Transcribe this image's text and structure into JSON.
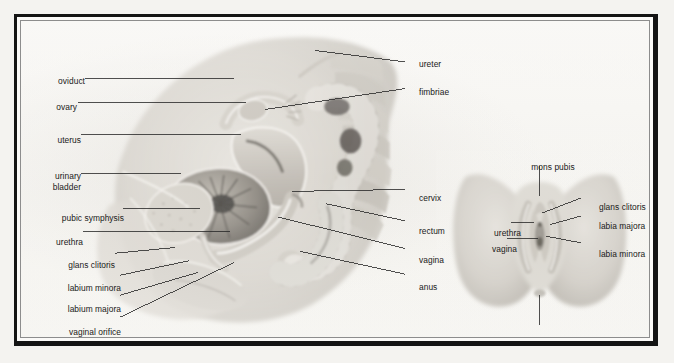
{
  "figure": {
    "panels": [
      {
        "id": "sagittal",
        "name": "midsagittal-section-female-pelvis",
        "labels_left": [
          {
            "key": "oviduct",
            "text": "oviduct",
            "x": 30,
            "y": 74,
            "line_to_x": 232,
            "line_to_y": 74
          },
          {
            "key": "ovary",
            "text": "ovary",
            "x": 30,
            "y": 100,
            "line_to_x": 245,
            "line_to_y": 100
          },
          {
            "key": "uterus",
            "text": "uterus",
            "x": 30,
            "y": 133,
            "line_to_x": 240,
            "line_to_y": 133
          },
          {
            "key": "urinary_bladder",
            "text": "urinary",
            "text2": "bladder",
            "x": 30,
            "y": 174,
            "line_to_x": 178,
            "line_to_y": 174
          },
          {
            "key": "pubic_symphysis",
            "text": "pubic symphysis",
            "x": 30,
            "y": 211,
            "line_to_x": 198,
            "line_to_y": 211
          },
          {
            "key": "urethra",
            "text": "urethra",
            "x": 30,
            "y": 235,
            "line_to_x": 228,
            "line_to_y": 235
          },
          {
            "key": "glans_clitoris",
            "text": "glans clitoris",
            "x": 30,
            "y": 258,
            "line_to_x": 172,
            "line_to_y": 252
          },
          {
            "key": "labium_minora",
            "text": "labium minora",
            "x": 30,
            "y": 281,
            "line_to_x": 186,
            "line_to_y": 266
          },
          {
            "key": "labium_majora",
            "text": "labium majora",
            "x": 30,
            "y": 302,
            "line_to_x": 196,
            "line_to_y": 278
          },
          {
            "key": "vaginal_orifice",
            "text": "vaginal orifice",
            "x": 30,
            "y": 325,
            "line_to_x": 232,
            "line_to_y": 268
          }
        ],
        "labels_right": [
          {
            "key": "ureter",
            "text": "ureter",
            "x": 412,
            "y": 57,
            "line_to_x": 316,
            "line_to_y": 45
          },
          {
            "key": "fimbriae",
            "text": "fimbriae",
            "x": 412,
            "y": 85,
            "line_to_x": 264,
            "line_to_y": 107
          },
          {
            "key": "cervix",
            "text": "cervix",
            "x": 412,
            "y": 191,
            "line_to_x": 292,
            "line_to_y": 193
          },
          {
            "key": "rectum",
            "text": "rectum",
            "x": 412,
            "y": 224,
            "line_to_x": 327,
            "line_to_y": 206
          },
          {
            "key": "vagina",
            "text": "vagina",
            "x": 412,
            "y": 253,
            "line_to_x": 278,
            "line_to_y": 220
          },
          {
            "key": "anus",
            "text": "anus",
            "x": 412,
            "y": 280,
            "line_to_x": 300,
            "line_to_y": 256
          }
        ]
      },
      {
        "id": "perineum",
        "name": "external-genitalia-inset",
        "labels_top": [
          {
            "key": "mons_pubis",
            "text": "mons pubis",
            "x": 546,
            "y": 160,
            "line_to_x": 546,
            "line_to_y": 196
          }
        ],
        "labels_bottom": [
          {
            "key": "anus",
            "text": "anus",
            "x": 546,
            "y": 333,
            "line_to_x": 546,
            "line_to_y": 300
          }
        ],
        "labels_left": [
          {
            "key": "urethra",
            "text": "urethra",
            "x": 488,
            "y": 226,
            "line_to_x": 540,
            "line_to_y": 226
          },
          {
            "key": "vagina",
            "text": "vagina",
            "x": 488,
            "y": 242,
            "line_to_x": 540,
            "line_to_y": 242
          }
        ],
        "labels_right": [
          {
            "key": "glans_clitoris",
            "text": "glans clitoris",
            "x": 592,
            "y": 200,
            "line_to_x": 548,
            "line_to_y": 216
          },
          {
            "key": "labia_majora",
            "text": "labia majora",
            "x": 592,
            "y": 219,
            "line_to_x": 556,
            "line_to_y": 228
          },
          {
            "key": "labia_minora",
            "text": "labia minora",
            "x": 592,
            "y": 247,
            "line_to_x": 552,
            "line_to_y": 240
          }
        ]
      }
    ]
  },
  "colors": {
    "frame": "#141414",
    "mat": "#fbfaf8",
    "inner_rule": "#8d8d8d",
    "paper": "#f6f5f1",
    "label_text": "#191919",
    "leader_line": "#2a2a2a",
    "tissue_light": "#dedbd5",
    "tissue_mid": "#c4c0b8",
    "tissue_dark": "#9b978e",
    "tissue_deep": "#6e6a63"
  }
}
